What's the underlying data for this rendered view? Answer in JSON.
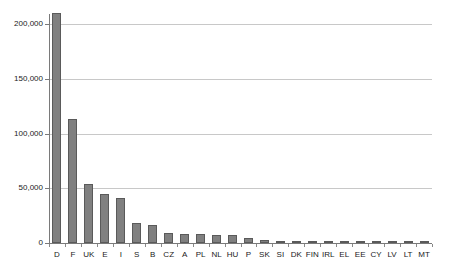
{
  "chart_data": {
    "type": "bar",
    "title": "",
    "subtitle": "",
    "xlabel": "",
    "ylabel": "",
    "categories": [
      "D",
      "F",
      "UK",
      "E",
      "I",
      "S",
      "B",
      "CZ",
      "A",
      "PL",
      "NL",
      "HU",
      "P",
      "SK",
      "SI",
      "DK",
      "FIN",
      "IRL",
      "EL",
      "EE",
      "CY",
      "LV",
      "LT",
      "MT"
    ],
    "values": [
      210000,
      113000,
      54000,
      45000,
      41000,
      18000,
      16000,
      9000,
      8000,
      8000,
      7500,
      7000,
      5000,
      3000,
      1500,
      1200,
      900,
      700,
      500,
      400,
      300,
      250,
      200,
      100
    ],
    "ylim": [
      0,
      220000
    ],
    "yticks": [
      0,
      50000,
      100000,
      150000,
      200000
    ],
    "ytick_labels": [
      "0",
      "50,000",
      "100,000",
      "150,000",
      "200,000"
    ],
    "grid": true,
    "legend": false,
    "legend_position": "none",
    "bar_color": "#808080",
    "bar_border_color": "#5a5a5a",
    "gridline_color": "#c8c8c8",
    "axis_color": "#7a7a7a",
    "background_color": "#ffffff"
  }
}
